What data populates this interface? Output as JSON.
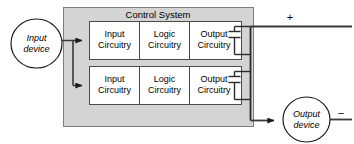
{
  "diagram": {
    "title": "Control System",
    "panel": {
      "label": "Control System",
      "fill": "#d4d4d4",
      "stroke": "#6b6b6b"
    },
    "nodes": {
      "input_device": {
        "line1": "Input",
        "line2": "device",
        "shape": "ellipse",
        "fill": "#ffffff",
        "stroke": "#1a1a1a"
      },
      "output_device": {
        "line1": "Output",
        "line2": "device",
        "shape": "ellipse",
        "fill": "#ffffff",
        "stroke": "#1a1a1a"
      }
    },
    "rows": [
      {
        "name": "channel-1",
        "blocks": [
          {
            "line1": "Input",
            "line2": "Circuitry"
          },
          {
            "line1": "Logic",
            "line2": "Circuitry"
          },
          {
            "line1": "Output",
            "line2": "Circuitry"
          }
        ]
      },
      {
        "name": "channel-2",
        "blocks": [
          {
            "line1": "Input",
            "line2": "Circuitry"
          },
          {
            "line1": "Logic",
            "line2": "Circuitry"
          },
          {
            "line1": "Output",
            "line2": "Circuitry"
          }
        ]
      }
    ],
    "terminals": {
      "positive": "+",
      "negative": "−"
    },
    "colors": {
      "block_fill": "#ffffff",
      "block_stroke": "#4a4a4a",
      "wire": "#3a3a3a",
      "text": "#000000"
    }
  }
}
